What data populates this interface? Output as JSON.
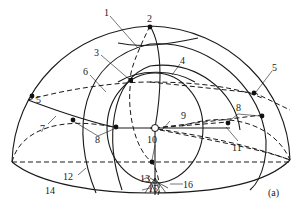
{
  "figure": {
    "panel_label": "(a)"
  },
  "labels": {
    "l1": "1",
    "l2": "2",
    "l3": "3",
    "l4": "4",
    "l5a": "5",
    "l5b": "5",
    "l6": "6",
    "l7": "7",
    "l8a": "8",
    "l8b": "8",
    "l9": "9",
    "l10": "10",
    "l11": "11",
    "l12": "12",
    "l13": "13",
    "l14": "14",
    "l15": "15",
    "l16": "16"
  },
  "colors": {
    "stroke": "#1a1a1a",
    "background": "#ffffff"
  }
}
